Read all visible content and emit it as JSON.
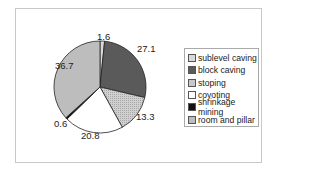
{
  "chart_data": {
    "type": "pie",
    "title": "",
    "categories": [
      "sublevel caving",
      "block caving",
      "stoping",
      "coyoting",
      "shrinkage mining",
      "room and pillar"
    ],
    "values": [
      1.6,
      27.1,
      13.3,
      20.8,
      0.6,
      36.7
    ],
    "data_labels": [
      "1.6",
      "27.1",
      "13.3",
      "20.8",
      "0.6",
      "36.7"
    ],
    "colors": [
      "#d9d9d9",
      "#5a5a5a",
      "#c8c8c8",
      "#ffffff",
      "#111111",
      "#bdbdbd"
    ],
    "legend_position": "right",
    "start_angle_deg": 0,
    "direction": "clockwise"
  },
  "legend": {
    "items": [
      {
        "label": "sublevel caving",
        "color": "#d9d9d9"
      },
      {
        "label": "block caving",
        "color": "#5a5a5a"
      },
      {
        "label": "stoping",
        "color": "#c8c8c8"
      },
      {
        "label": "coyoting",
        "color": "#ffffff"
      },
      {
        "label": "shrinkage mining",
        "color": "#111111"
      },
      {
        "label": "room and pillar",
        "color": "#bdbdbd"
      }
    ]
  },
  "labels": {
    "sublevel_caving": "1.6",
    "block_caving": "27.1",
    "stoping": "13.3",
    "coyoting": "20.8",
    "shrinkage_mining": "0.6",
    "room_and_pillar": "36.7"
  }
}
